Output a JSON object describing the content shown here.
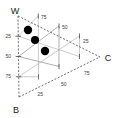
{
  "chart_data": {
    "type": "scatter",
    "title": "",
    "subtitle": "",
    "plot_style": "ternary",
    "grid": true,
    "legend_position": "none",
    "vertices": [
      {
        "id": "W",
        "label": "W",
        "position": "top-left",
        "px": [
          18,
          16
        ],
        "label_px": [
          15,
          11
        ]
      },
      {
        "id": "B",
        "label": "B",
        "position": "bottom-left",
        "px": [
          19,
          97
        ],
        "label_px": [
          15,
          110
        ]
      },
      {
        "id": "C",
        "label": "C",
        "position": "right",
        "px": [
          100,
          57
        ],
        "label_px": [
          104,
          61
        ]
      }
    ],
    "axes": [
      {
        "name": "W-B axis",
        "label": "",
        "side": "left",
        "ticks": [
          "25",
          "50",
          "75"
        ],
        "tick_values": [
          25,
          50,
          75
        ],
        "tick_px": [
          [
            13,
            35
          ],
          [
            13,
            56
          ],
          [
            13,
            78
          ]
        ],
        "range": [
          0,
          100
        ]
      },
      {
        "name": "W-C axis",
        "label": "",
        "side": "upper-right",
        "ticks": [
          "75",
          "50",
          "25"
        ],
        "tick_values": [
          75,
          50,
          25
        ],
        "tick_px": [
          [
            43,
            20
          ],
          [
            64,
            30
          ],
          [
            88,
            44
          ]
        ],
        "range": [
          0,
          100
        ]
      },
      {
        "name": "B-C axis",
        "label": "",
        "side": "lower-right",
        "ticks": [
          "25",
          "50",
          "75"
        ],
        "tick_values": [
          25,
          50,
          75
        ],
        "tick_px": [
          [
            40,
            95
          ],
          [
            64,
            84
          ],
          [
            88,
            73
          ]
        ],
        "range": [
          0,
          100
        ]
      }
    ],
    "series": [
      {
        "name": "samples",
        "marker": "filled-circle",
        "color": "#000000",
        "values": [
          {
            "px": [
              28,
              30
            ],
            "r": 4.2
          },
          {
            "px": [
              35,
              40
            ],
            "r": 4.0
          },
          {
            "px": [
              45,
              51
            ],
            "r": 4.2
          }
        ]
      }
    ],
    "grid_intervals": [
      25,
      50,
      75
    ],
    "colors": {
      "axis": "#4a4a4a",
      "grid": "#b4b4b4",
      "marker": "#000000",
      "text": "#1a1a1a",
      "background": "#ffffff"
    }
  },
  "labels": {
    "vertex_w": "W",
    "vertex_b": "B",
    "vertex_c": "C",
    "t_left_25": "25",
    "t_left_50": "50",
    "t_left_75": "75",
    "t_top_75": "75",
    "t_top_50": "50",
    "t_top_25": "25",
    "t_bot_25": "25",
    "t_bot_50": "50",
    "t_bot_75": "75"
  }
}
